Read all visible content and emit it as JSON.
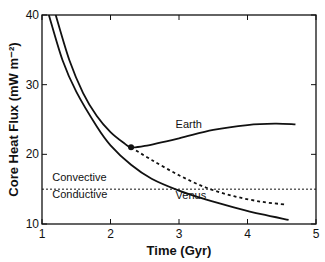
{
  "chart_data": {
    "type": "line",
    "title": "",
    "xlabel": "Time (Gyr)",
    "ylabel": "Core Heat Flux (mW m⁻²)",
    "xlim": [
      1,
      5
    ],
    "ylim": [
      10,
      40
    ],
    "xticks": [
      "1",
      "2",
      "3",
      "4",
      "5"
    ],
    "yticks": [
      "10",
      "20",
      "30",
      "40"
    ],
    "grid": false,
    "series": [
      {
        "name": "Earth",
        "style": "solid",
        "x": [
          1.2,
          1.4,
          1.6,
          1.8,
          2.0,
          2.2,
          2.3,
          2.5,
          3.0,
          3.5,
          4.0,
          4.4,
          4.7
        ],
        "y": [
          40,
          33.5,
          28.8,
          25.5,
          23.2,
          21.6,
          21.0,
          21.2,
          22.3,
          23.5,
          24.2,
          24.4,
          24.3
        ]
      },
      {
        "name": "Earth (no inner core)",
        "style": "dashed",
        "x": [
          2.3,
          2.6,
          3.0,
          3.4,
          3.8,
          4.2,
          4.55
        ],
        "y": [
          21.0,
          19.2,
          17.0,
          15.2,
          14.0,
          13.2,
          12.8
        ]
      },
      {
        "name": "Venus",
        "style": "solid",
        "x": [
          1.1,
          1.3,
          1.5,
          1.8,
          2.0,
          2.3,
          2.6,
          3.0,
          3.4,
          3.8,
          4.2,
          4.6
        ],
        "y": [
          40,
          33.5,
          29.0,
          24.0,
          21.3,
          18.5,
          16.5,
          14.8,
          13.5,
          12.4,
          11.4,
          10.6
        ]
      }
    ],
    "reference_line": {
      "y": 15,
      "style": "dotted",
      "labels": [
        "Convective",
        "Conductive"
      ]
    },
    "annotations": [
      {
        "text": "Earth",
        "x": 2.95,
        "y": 23.8
      },
      {
        "text": "Venus",
        "x": 2.95,
        "y": 13.6
      },
      {
        "text": "Convective",
        "x": 1.15,
        "y": 16.2
      },
      {
        "text": "Conductive",
        "x": 1.15,
        "y": 13.7
      }
    ],
    "marker": {
      "x": 2.3,
      "y": 21.0
    }
  }
}
